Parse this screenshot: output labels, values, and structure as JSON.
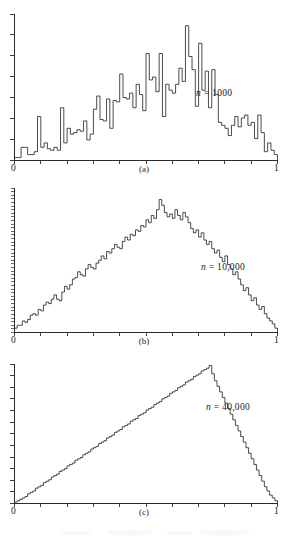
{
  "figure": {
    "title": "",
    "background_color": "#ffffff",
    "ink_color": "#2b2b2b"
  },
  "panels": [
    {
      "id": "a",
      "caption": "(a)",
      "n_label_prefix": "n",
      "n_label_equals": " = ",
      "n_label_value": "1000",
      "x_axis_min_label": "0",
      "x_axis_max_label": "1"
    },
    {
      "id": "b",
      "caption": "(b)",
      "n_label_prefix": "n",
      "n_label_equals": " = ",
      "n_label_value": "10,000",
      "x_axis_min_label": "0",
      "x_axis_max_label": "1"
    },
    {
      "id": "c",
      "caption": "(c)",
      "n_label_prefix": "n",
      "n_label_equals": " = ",
      "n_label_value": "40,000",
      "x_axis_min_label": "0",
      "x_axis_max_label": "1"
    }
  ],
  "chart_data": [
    {
      "type": "bar",
      "subplot": "a",
      "title": "",
      "annotation": "n = 1000",
      "xlabel": "",
      "ylabel": "",
      "xlim": [
        0,
        1
      ],
      "ylim": [
        0,
        1
      ],
      "x_tick_labels": [
        "0",
        "1"
      ],
      "x_tick_count": 11,
      "y_tick_count": 7,
      "grid": false,
      "legend": "none",
      "bin_count": 80,
      "note": "Histogram of 1000 samples from a triangular distribution on [0,1]; heights normalized to the panel height, very noisy.",
      "values": [
        0.02,
        0.02,
        0.09,
        0.09,
        0.04,
        0.04,
        0.06,
        0.3,
        0.09,
        0.12,
        0.08,
        0.07,
        0.09,
        0.07,
        0.36,
        0.12,
        0.22,
        0.18,
        0.19,
        0.21,
        0.2,
        0.27,
        0.14,
        0.18,
        0.35,
        0.44,
        0.28,
        0.27,
        0.42,
        0.22,
        0.41,
        0.4,
        0.59,
        0.43,
        0.42,
        0.46,
        0.36,
        0.52,
        0.45,
        0.34,
        0.73,
        0.55,
        0.57,
        0.47,
        0.73,
        0.3,
        0.52,
        0.48,
        0.46,
        0.52,
        0.63,
        0.54,
        0.92,
        0.71,
        0.62,
        0.37,
        0.8,
        0.48,
        0.61,
        0.36,
        0.62,
        0.45,
        0.26,
        0.24,
        0.22,
        0.17,
        0.24,
        0.3,
        0.23,
        0.29,
        0.31,
        0.24,
        0.26,
        0.15,
        0.31,
        0.19,
        0.06,
        0.12,
        0.07,
        0.04
      ]
    },
    {
      "type": "bar",
      "subplot": "b",
      "title": "",
      "annotation": "n = 10,000",
      "xlabel": "",
      "ylabel": "",
      "xlim": [
        0,
        1
      ],
      "ylim": [
        0,
        1
      ],
      "x_tick_labels": [
        "0",
        "1"
      ],
      "x_tick_count": 11,
      "y_tick_count": 40,
      "grid": false,
      "legend": "none",
      "bin_count": 90,
      "note": "Histogram of 10,000 samples from a triangular distribution on [0,1]; shape clearly triangular with moderate noise.",
      "values": [
        0.03,
        0.05,
        0.05,
        0.08,
        0.07,
        0.09,
        0.12,
        0.13,
        0.12,
        0.16,
        0.15,
        0.19,
        0.21,
        0.2,
        0.23,
        0.26,
        0.23,
        0.22,
        0.28,
        0.32,
        0.3,
        0.33,
        0.37,
        0.38,
        0.42,
        0.4,
        0.39,
        0.44,
        0.47,
        0.45,
        0.44,
        0.48,
        0.5,
        0.53,
        0.51,
        0.56,
        0.55,
        0.58,
        0.61,
        0.59,
        0.58,
        0.63,
        0.66,
        0.64,
        0.68,
        0.67,
        0.71,
        0.7,
        0.74,
        0.73,
        0.78,
        0.76,
        0.81,
        0.79,
        0.85,
        0.92,
        0.88,
        0.83,
        0.8,
        0.82,
        0.79,
        0.85,
        0.81,
        0.78,
        0.83,
        0.8,
        0.76,
        0.72,
        0.69,
        0.71,
        0.66,
        0.69,
        0.64,
        0.61,
        0.63,
        0.58,
        0.55,
        0.57,
        0.52,
        0.49,
        0.53,
        0.47,
        0.44,
        0.4,
        0.42,
        0.37,
        0.33,
        0.29,
        0.31,
        0.26,
        0.22,
        0.24,
        0.19,
        0.16,
        0.18,
        0.13,
        0.1,
        0.08,
        0.06,
        0.03
      ]
    },
    {
      "type": "bar",
      "subplot": "c",
      "title": "",
      "annotation": "n = 40,000",
      "xlabel": "",
      "ylabel": "",
      "xlim": [
        0,
        1
      ],
      "ylim": [
        0,
        1
      ],
      "x_tick_labels": [
        "0",
        "1"
      ],
      "x_tick_count": 11,
      "y_tick_count": 12,
      "grid": false,
      "legend": "none",
      "bin_count": 100,
      "note": "Histogram of 40,000 samples from a triangular distribution on [0,1]; nearly a smooth triangle, small step noise.",
      "values": [
        0.01,
        0.02,
        0.03,
        0.04,
        0.05,
        0.07,
        0.08,
        0.09,
        0.11,
        0.12,
        0.13,
        0.15,
        0.16,
        0.17,
        0.19,
        0.2,
        0.21,
        0.23,
        0.24,
        0.25,
        0.27,
        0.28,
        0.29,
        0.31,
        0.32,
        0.33,
        0.35,
        0.36,
        0.37,
        0.39,
        0.4,
        0.41,
        0.43,
        0.44,
        0.45,
        0.47,
        0.48,
        0.49,
        0.51,
        0.52,
        0.53,
        0.55,
        0.56,
        0.57,
        0.59,
        0.6,
        0.61,
        0.63,
        0.64,
        0.65,
        0.67,
        0.68,
        0.69,
        0.71,
        0.72,
        0.73,
        0.75,
        0.76,
        0.77,
        0.79,
        0.8,
        0.81,
        0.83,
        0.84,
        0.85,
        0.87,
        0.88,
        0.89,
        0.91,
        0.92,
        0.93,
        0.95,
        0.96,
        0.97,
        0.99,
        0.93,
        0.88,
        0.84,
        0.8,
        0.76,
        0.72,
        0.68,
        0.64,
        0.6,
        0.56,
        0.52,
        0.48,
        0.44,
        0.4,
        0.36,
        0.32,
        0.28,
        0.24,
        0.2,
        0.16,
        0.12,
        0.09,
        0.06,
        0.04,
        0.02
      ]
    }
  ]
}
